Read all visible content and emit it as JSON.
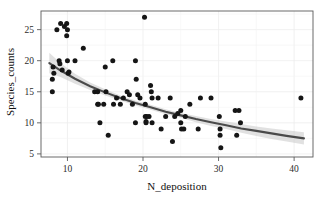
{
  "chart_data": {
    "type": "scatter",
    "title": "",
    "subtitle": "",
    "xlabel": "N_deposition",
    "ylabel": "Species_counts",
    "xlim": [
      6.5,
      42.5
    ],
    "ylim": [
      4.5,
      28.0
    ],
    "xticks": [
      10,
      20,
      30,
      40
    ],
    "yticks": [
      5,
      10,
      15,
      20,
      25
    ],
    "grid": true,
    "legend": null,
    "legend_position": "none",
    "point_color": "#151515",
    "fit_line_color": "#4a4a4a",
    "ci_band_color": "#c9c9c9",
    "frame_color": "#5a5a5a",
    "grid_color": "#eeeeee",
    "background_color": "#ffffff",
    "points": [
      [
        8.0,
        15.0
      ],
      [
        8.0,
        17.0
      ],
      [
        8.1,
        19.0
      ],
      [
        8.2,
        18.0
      ],
      [
        8.6,
        25.0
      ],
      [
        8.9,
        20.0
      ],
      [
        9.0,
        19.5
      ],
      [
        9.1,
        26.0
      ],
      [
        9.3,
        18.5
      ],
      [
        9.6,
        25.5
      ],
      [
        9.9,
        26.0
      ],
      [
        9.9,
        24.0
      ],
      [
        10.0,
        25.0
      ],
      [
        10.0,
        20.0
      ],
      [
        10.1,
        18.0
      ],
      [
        10.2,
        18.2
      ],
      [
        11.0,
        20.0
      ],
      [
        12.1,
        22.0
      ],
      [
        13.6,
        15.0
      ],
      [
        14.0,
        15.0
      ],
      [
        14.0,
        13.0
      ],
      [
        14.1,
        13.0
      ],
      [
        14.3,
        10.0
      ],
      [
        14.8,
        13.0
      ],
      [
        15.0,
        19.0
      ],
      [
        15.1,
        15.0
      ],
      [
        15.4,
        8.0
      ],
      [
        16.0,
        20.0
      ],
      [
        16.1,
        13.0
      ],
      [
        16.5,
        14.0
      ],
      [
        17.0,
        13.0
      ],
      [
        17.4,
        14.0
      ],
      [
        17.9,
        15.0
      ],
      [
        18.2,
        14.5
      ],
      [
        18.6,
        13.0
      ],
      [
        19.0,
        20.0
      ],
      [
        19.0,
        10.0
      ],
      [
        19.1,
        17.0
      ],
      [
        19.3,
        14.5
      ],
      [
        19.6,
        14.0
      ],
      [
        20.2,
        27.0
      ],
      [
        20.3,
        13.0
      ],
      [
        20.3,
        11.0
      ],
      [
        20.4,
        10.0
      ],
      [
        20.4,
        10.2
      ],
      [
        20.5,
        11.0
      ],
      [
        20.8,
        11.0
      ],
      [
        21.0,
        16.0
      ],
      [
        21.1,
        15.0
      ],
      [
        21.2,
        14.0
      ],
      [
        21.2,
        10.0
      ],
      [
        22.0,
        14.0
      ],
      [
        22.4,
        9.0
      ],
      [
        23.0,
        11.0
      ],
      [
        23.6,
        14.0
      ],
      [
        23.9,
        7.0
      ],
      [
        24.2,
        11.0
      ],
      [
        24.6,
        11.5
      ],
      [
        25.0,
        12.0
      ],
      [
        25.0,
        10.0
      ],
      [
        25.1,
        9.0
      ],
      [
        25.4,
        9.0
      ],
      [
        25.6,
        11.0
      ],
      [
        26.2,
        13.0
      ],
      [
        27.3,
        9.0
      ],
      [
        27.6,
        14.0
      ],
      [
        29.0,
        14.0
      ],
      [
        30.1,
        11.0
      ],
      [
        30.2,
        9.0
      ],
      [
        30.2,
        8.0
      ],
      [
        30.3,
        6.0
      ],
      [
        32.2,
        12.0
      ],
      [
        32.4,
        8.0
      ],
      [
        32.7,
        12.0
      ],
      [
        32.9,
        10.0
      ],
      [
        40.9,
        14.0
      ]
    ],
    "fit_line": [
      [
        7.6,
        19.6
      ],
      [
        9.0,
        18.5
      ],
      [
        11.0,
        17.1
      ],
      [
        13.0,
        15.9
      ],
      [
        15.0,
        14.9
      ],
      [
        17.0,
        14.0
      ],
      [
        19.0,
        13.2
      ],
      [
        21.0,
        12.5
      ],
      [
        23.0,
        11.8
      ],
      [
        25.0,
        11.2
      ],
      [
        27.0,
        10.6
      ],
      [
        29.0,
        10.1
      ],
      [
        31.0,
        9.6
      ],
      [
        33.0,
        9.1
      ],
      [
        35.0,
        8.7
      ],
      [
        37.0,
        8.3
      ],
      [
        39.0,
        7.9
      ],
      [
        41.3,
        7.5
      ]
    ],
    "ci_upper": [
      [
        7.6,
        21.3
      ],
      [
        9.0,
        19.7
      ],
      [
        11.0,
        17.9
      ],
      [
        13.0,
        16.5
      ],
      [
        15.0,
        15.4
      ],
      [
        17.0,
        14.4
      ],
      [
        19.0,
        13.6
      ],
      [
        21.0,
        12.9
      ],
      [
        23.0,
        12.2
      ],
      [
        25.0,
        11.6
      ],
      [
        27.0,
        11.1
      ],
      [
        29.0,
        10.6
      ],
      [
        31.0,
        10.2
      ],
      [
        33.0,
        9.8
      ],
      [
        35.0,
        9.4
      ],
      [
        37.0,
        9.1
      ],
      [
        39.0,
        8.8
      ],
      [
        41.3,
        8.5
      ]
    ],
    "ci_lower": [
      [
        7.6,
        18.0
      ],
      [
        9.0,
        17.4
      ],
      [
        11.0,
        16.3
      ],
      [
        13.0,
        15.3
      ],
      [
        15.0,
        14.4
      ],
      [
        17.0,
        13.6
      ],
      [
        19.0,
        12.8
      ],
      [
        21.0,
        12.1
      ],
      [
        23.0,
        11.4
      ],
      [
        25.0,
        10.8
      ],
      [
        27.0,
        10.1
      ],
      [
        29.0,
        9.5
      ],
      [
        31.0,
        9.0
      ],
      [
        33.0,
        8.4
      ],
      [
        35.0,
        7.9
      ],
      [
        37.0,
        7.4
      ],
      [
        39.0,
        7.0
      ],
      [
        41.3,
        6.5
      ]
    ]
  }
}
